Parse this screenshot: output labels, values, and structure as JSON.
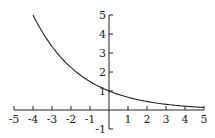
{
  "chart_data": {
    "type": "line",
    "title": "",
    "xlabel": "",
    "ylabel": "",
    "xlim": [
      -5,
      5
    ],
    "ylim": [
      -1,
      5
    ],
    "grid": false,
    "x_ticks": [
      "-5",
      "-4",
      "-3",
      "-2",
      "-1",
      "1",
      "2",
      "3",
      "4",
      "5"
    ],
    "y_ticks": [
      "5",
      "4",
      "3",
      "2",
      "1",
      "-1"
    ],
    "series": [
      {
        "name": "exponential decay",
        "x": [
          -4,
          -3,
          -2,
          -1,
          0,
          1,
          2,
          3,
          4,
          5
        ],
        "values": [
          5.0,
          3.34,
          2.24,
          1.5,
          1.0,
          0.67,
          0.45,
          0.3,
          0.2,
          0.13
        ]
      }
    ]
  },
  "colors": {
    "axis": "#222222",
    "curve": "#222222",
    "background": "#ffffff"
  }
}
